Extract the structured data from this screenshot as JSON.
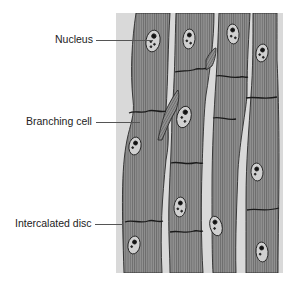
{
  "figure": {
    "labels": [
      {
        "id": "nucleus",
        "text": "Nucleus"
      },
      {
        "id": "branching_cell",
        "text": "Branching cell"
      },
      {
        "id": "intercalated_disc",
        "text": "Intercalated disc"
      }
    ]
  },
  "colors": {
    "background": "#d8d8d8",
    "cell_fill": "#8f8f8f",
    "striation": "#6e6e6e",
    "outline": "#2a2a2a",
    "nucleus_fill": "#d2d2d2",
    "label_text": "#222222"
  }
}
